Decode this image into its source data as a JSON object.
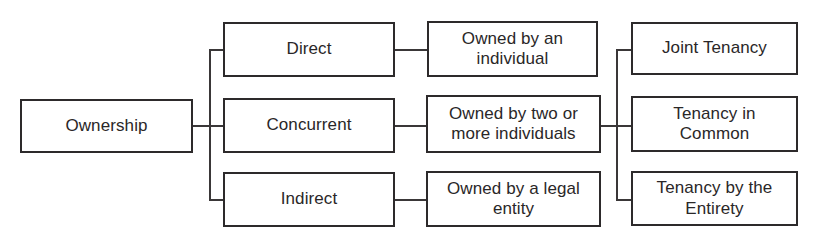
{
  "diagram": {
    "type": "hierarchy-tree",
    "title": "Ownership",
    "orientation": "left-to-right",
    "colors": {
      "background": "#ffffff",
      "box_border": "#2d2a2b",
      "connector": "#3a3738",
      "text": "#2a2728"
    },
    "nodes": [
      {
        "id": "ownership",
        "label": "Ownership",
        "column": 1,
        "row": 2,
        "x": 20,
        "y": 99,
        "width": 173,
        "height": 54
      },
      {
        "id": "direct",
        "label": "Direct",
        "column": 2,
        "row": 1,
        "x": 223,
        "y": 22,
        "width": 172,
        "height": 55
      },
      {
        "id": "concurrent",
        "label": "Concurrent",
        "column": 2,
        "row": 2,
        "x": 223,
        "y": 98,
        "width": 172,
        "height": 55
      },
      {
        "id": "indirect",
        "label": "Indirect",
        "column": 2,
        "row": 3,
        "x": 223,
        "y": 172,
        "width": 172,
        "height": 55
      },
      {
        "id": "owned-individual",
        "label": "Owned by an individual",
        "line1": "Owned by an",
        "line2": "individual",
        "column": 3,
        "row": 1,
        "x": 427,
        "y": 21,
        "width": 171,
        "height": 56
      },
      {
        "id": "owned-two-or-more",
        "label": "Owned by two or more individuals",
        "line1": "Owned by two or",
        "line2": "more individuals",
        "column": 3,
        "row": 2,
        "x": 426,
        "y": 95,
        "width": 175,
        "height": 58
      },
      {
        "id": "owned-legal-entity",
        "label": "Owned by a legal entity",
        "line1": "Owned by a legal",
        "line2": "entity",
        "column": 3,
        "row": 3,
        "x": 426,
        "y": 171,
        "width": 175,
        "height": 56
      },
      {
        "id": "joint-tenancy",
        "label": "Joint Tenancy",
        "line1": "Joint Tenancy",
        "line2": "",
        "column": 4,
        "row": 1,
        "x": 631,
        "y": 22,
        "width": 167,
        "height": 53
      },
      {
        "id": "tenancy-in-common",
        "label": "Tenancy in Common",
        "line1": "Tenancy in",
        "line2": "Common",
        "column": 4,
        "row": 2,
        "x": 631,
        "y": 96,
        "width": 167,
        "height": 56
      },
      {
        "id": "tenancy-by-entirety",
        "label": "Tenancy by the Entirety",
        "line1": "Tenancy by the",
        "line2": "Entirety",
        "column": 4,
        "row": 3,
        "x": 631,
        "y": 171,
        "width": 167,
        "height": 55
      }
    ],
    "edges": [
      {
        "id": "ownership-to-trunk1",
        "from": "ownership",
        "to": "trunk-1"
      },
      {
        "id": "trunk1-to-direct",
        "from": "trunk-1",
        "to": "direct"
      },
      {
        "id": "trunk1-to-concurrent",
        "from": "trunk-1",
        "to": "concurrent"
      },
      {
        "id": "trunk1-to-indirect",
        "from": "trunk-1",
        "to": "indirect"
      },
      {
        "id": "direct-to-owned-individual",
        "from": "direct",
        "to": "owned-individual"
      },
      {
        "id": "concurrent-to-owned-two-or-more",
        "from": "concurrent",
        "to": "owned-two-or-more"
      },
      {
        "id": "indirect-to-owned-legal-entity",
        "from": "indirect",
        "to": "owned-legal-entity"
      },
      {
        "id": "owned-two-or-more-to-trunk2",
        "from": "owned-two-or-more",
        "to": "trunk-2"
      },
      {
        "id": "trunk2-to-joint-tenancy",
        "from": "trunk-2",
        "to": "joint-tenancy"
      },
      {
        "id": "trunk2-to-tenancy-in-common",
        "from": "trunk-2",
        "to": "tenancy-in-common"
      },
      {
        "id": "trunk2-to-tenancy-by-entirety",
        "from": "trunk-2",
        "to": "tenancy-by-entirety"
      }
    ]
  }
}
